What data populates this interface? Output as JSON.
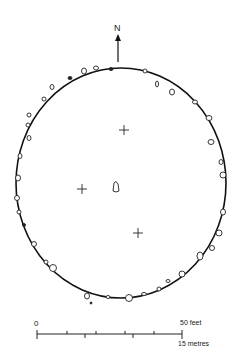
{
  "diagram": {
    "north_label": "N",
    "ellipse": {
      "cx": 121,
      "cy": 183,
      "rx": 105,
      "ry": 115
    },
    "crosses": [
      {
        "x": 124,
        "y": 130
      },
      {
        "x": 82,
        "y": 189
      },
      {
        "x": 138,
        "y": 233
      }
    ],
    "center_stone": {
      "x": 116,
      "y": 187
    },
    "scale": {
      "zero_label": "0",
      "feet_label": "50 feet",
      "metres_label": "15 metres"
    }
  }
}
